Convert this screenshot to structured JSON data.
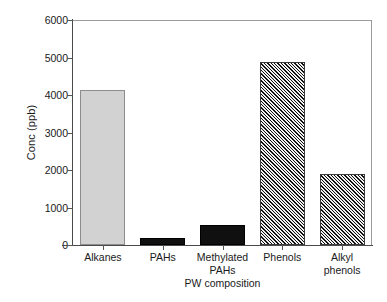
{
  "chart_data": {
    "type": "bar",
    "title": "",
    "xlabel": "PW composition",
    "ylabel": "Conc (ppb)",
    "categories": [
      "Alkanes",
      "PAHs",
      "Methylated\nPAHs",
      "Phenols",
      "Alkyl\nphenols"
    ],
    "values": [
      4130,
      190,
      530,
      4880,
      1890
    ],
    "ylim": [
      0,
      6000
    ],
    "yticks": [
      0,
      1000,
      2000,
      3000,
      4000,
      5000,
      6000
    ],
    "ytick_labels": [
      "0",
      "1000",
      "2000",
      "3000",
      "4000",
      "5000",
      "6000"
    ],
    "grid": false,
    "legend": null,
    "bar_styles": [
      {
        "category": "Alkanes",
        "fill": "solid-light",
        "color": "#d2d2d2",
        "edge": "#8d8d8d"
      },
      {
        "category": "PAHs",
        "fill": "solid-dark",
        "color": "#101010",
        "edge": "#000000"
      },
      {
        "category": "Methylated PAHs",
        "fill": "solid-dark",
        "color": "#101010",
        "edge": "#000000"
      },
      {
        "category": "Phenols",
        "fill": "hatch-diagonal",
        "color": "#6b6b6b",
        "edge": "#3a3a3a"
      },
      {
        "category": "Alkyl phenols",
        "fill": "hatch-diagonal",
        "color": "#6b6b6b",
        "edge": "#3a3a3a"
      }
    ],
    "background": "#ffffff",
    "axis_color": "#4a4a4a",
    "frame_color": "#9a9a9a"
  }
}
